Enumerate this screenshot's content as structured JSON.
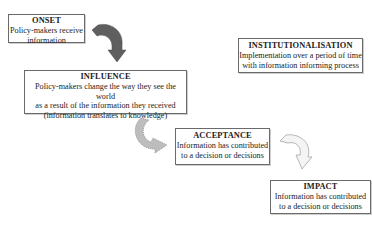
{
  "diagram": {
    "stages": [
      {
        "id": "onset",
        "title": "ONSET",
        "lines": [
          "Policy-makers receive",
          "information"
        ]
      },
      {
        "id": "influence",
        "title": "INFLUENCE",
        "lines": [
          "Policy-makers change the way they see the world",
          "as a result of the information they received",
          "(information translates to knowledge)"
        ]
      },
      {
        "id": "acceptance",
        "title": "ACCEPTANCE",
        "lines": [
          "Information has contributed",
          "to a decision or decisions"
        ]
      },
      {
        "id": "impact",
        "title": "IMPACT",
        "lines": [
          "Information has contributed",
          "to a decision or decisions"
        ]
      },
      {
        "id": "institutionalisation",
        "title": "INSTITUTIONALISATION",
        "lines": [
          "Implementation over a period of time",
          "with information informing process"
        ]
      }
    ],
    "arrows": [
      {
        "from": "onset",
        "to": "influence",
        "style": "solid-dark-gray",
        "color": "#5f5f5f"
      },
      {
        "from": "influence",
        "to": "acceptance",
        "style": "dotted-gray",
        "color": "#b4b4b4"
      },
      {
        "from": "acceptance",
        "to": "impact",
        "style": "outline-light",
        "color": "#f2f2f2"
      }
    ]
  }
}
